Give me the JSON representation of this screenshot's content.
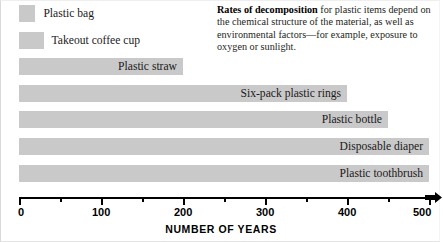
{
  "caption": {
    "lead": "Rates of decomposition",
    "rest": " for plastic items depend on the chemical structure of the material, as well as environmental factors—for example, exposure to oxygen or sunlight."
  },
  "chart_data": {
    "type": "bar",
    "orientation": "horizontal",
    "title": "",
    "xlabel": "NUMBER OF YEARS",
    "ylabel": "",
    "xlim": [
      0,
      500
    ],
    "grid": false,
    "legend": "none",
    "bar_color": "#c9c9c9",
    "axis_color": "#000000",
    "major_ticks": [
      0,
      100,
      200,
      300,
      400,
      500
    ],
    "minor_ticks": [
      50,
      150,
      250,
      350,
      450
    ],
    "tick_labels": [
      "0",
      "100",
      "200",
      "300",
      "400",
      "500"
    ],
    "categories": [
      "Plastic bag",
      "Takeout coffee cup",
      "Plastic straw",
      "Six-pack plastic rings",
      "Plastic bottle",
      "Disposable diaper",
      "Plastic toothbrush"
    ],
    "values": [
      20,
      30,
      200,
      400,
      450,
      500,
      500
    ],
    "label_placement": [
      "outside",
      "outside",
      "inside",
      "inside",
      "inside",
      "inside",
      "inside"
    ]
  }
}
